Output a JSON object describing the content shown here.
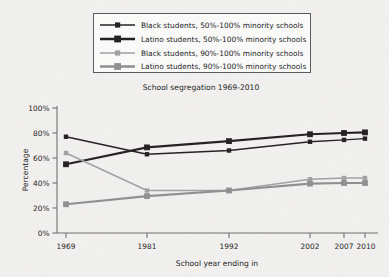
{
  "chart_data": {
    "type": "line",
    "title": "School segregation 1969-2010",
    "xlabel": "School year ending in",
    "ylabel": "Percentage",
    "categories": [
      "1969",
      "1981",
      "1992",
      "2002",
      "2007",
      "2010"
    ],
    "x_values": [
      1969,
      1981,
      1992,
      2002,
      2007,
      2010
    ],
    "xlim": [
      1966,
      2013
    ],
    "ylim": [
      0,
      100
    ],
    "y_ticks": [
      "0%",
      "20%",
      "40%",
      "60%",
      "80%",
      "100%"
    ],
    "y_tick_values": [
      0,
      20,
      40,
      60,
      80,
      100
    ],
    "grid": false,
    "legend_position": "above-plot",
    "series": [
      {
        "name": "Black students, 50%-100% minority schools",
        "values": [
          77,
          63,
          66,
          73,
          74.5,
          75.5
        ],
        "color": "#231f20",
        "line_width": 1.4,
        "marker": "square-small"
      },
      {
        "name": "Latino students, 50%-100% minority schools",
        "values": [
          55,
          68.5,
          73.5,
          79,
          80,
          80.5
        ],
        "color": "#231f20",
        "line_width": 2.2,
        "marker": "square-large"
      },
      {
        "name": "Black students, 90%-100% minority schools",
        "values": [
          64,
          34,
          34,
          43,
          44,
          44
        ],
        "color": "#a0a0a0",
        "line_width": 1.4,
        "marker": "square-small"
      },
      {
        "name": "Latino students, 90%-100% minority schools",
        "values": [
          23,
          29.5,
          34,
          39.5,
          40,
          40
        ],
        "color": "#8f8f8f",
        "line_width": 2.2,
        "marker": "square-large"
      }
    ]
  },
  "legend": {
    "items": [
      {
        "label": "Black students, 50%-100% minority schools"
      },
      {
        "label": "Latino students, 50%-100% minority schools"
      },
      {
        "label": "Black students, 90%-100% minority schools"
      },
      {
        "label": "Latino students, 90%-100% minority schools"
      }
    ]
  },
  "axes": {
    "y_tick_labels": [
      "100%",
      "80%",
      "60%",
      "40%",
      "20%",
      "0%"
    ],
    "x_tick_labels": [
      "1969",
      "1981",
      "1992",
      "2002",
      "2007",
      "2010"
    ]
  },
  "colors": {
    "background": "#f2f1ef",
    "dark_series": "#231f20",
    "light_series": "#a0a0a0",
    "axis": "#6e6e6e",
    "text": "#1a1a1a"
  }
}
